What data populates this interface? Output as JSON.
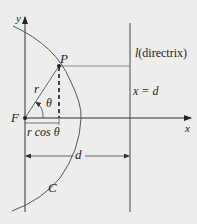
{
  "diagram": {
    "labels": {
      "y_axis": "y",
      "x_axis": "x",
      "point": "P",
      "focus": "F",
      "radius": "r",
      "angle": "θ",
      "projection": "r cos θ",
      "distance": "d",
      "curve": "C",
      "directrix_letter": "l",
      "directrix_word": "(directrix)",
      "directrix_eq": "x = d"
    },
    "colors": {
      "background": "#ededec",
      "axes": "#333333",
      "curve": "#555555",
      "guide_line": "#8a8a8a",
      "text": "#222222"
    }
  }
}
